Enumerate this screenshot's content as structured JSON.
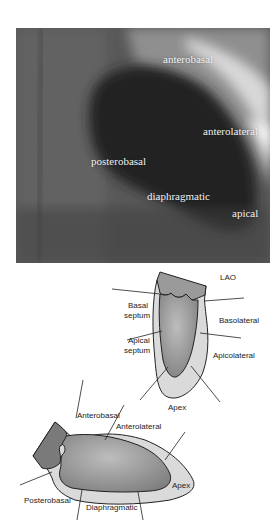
{
  "xray": {
    "labels": {
      "anterobasal": "anterobasal",
      "anterolateral": "anterolateral",
      "posterobasal": "posterobasal",
      "diaphragmatic": "diaphragmatic",
      "apical": "apical"
    }
  },
  "lao_diagram": {
    "title": "LAO",
    "labels": {
      "basal_septum_1": "Basal",
      "basal_septum_2": "septum",
      "apical_septum_1": "Apical",
      "apical_septum_2": "septum",
      "basolateral": "Basolateral",
      "apicolateral": "Apicolateral",
      "apex": "Apex"
    }
  },
  "rao_diagram": {
    "labels": {
      "anterobasal": "Anterobasal",
      "anterolateral": "Anterolateral",
      "apex": "Apex",
      "posterobasal": "Posterobasal",
      "diaphragmatic": "Diaphragmatic"
    }
  },
  "colors": {
    "outer_wall": "#d9d9d9",
    "cavity": "#8a8a8a",
    "atrium": "#777777",
    "outline": "#222222"
  }
}
